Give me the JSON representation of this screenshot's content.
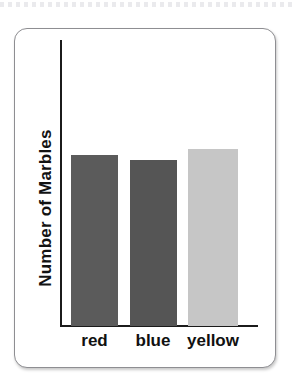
{
  "page": {
    "background_color": "#ffffff",
    "top_rule": {
      "style": "dotted",
      "color": "#e9e9ec"
    }
  },
  "card": {
    "border_color": "#8e8e92",
    "background_color": "#ffffff",
    "corner_radius_px": 13
  },
  "chart_data": {
    "type": "bar",
    "title": "",
    "subtitle": "",
    "xlabel": "",
    "ylabel": "Number of Marbles",
    "categories": [
      "red",
      "blue",
      "yellow"
    ],
    "values": [
      171,
      166,
      177
    ],
    "series": [
      {
        "name": "Number of Marbles",
        "values": [
          171,
          166,
          177
        ]
      }
    ],
    "bar_colors": [
      "#5b5b5b",
      "#555555",
      "#c6c6c6"
    ],
    "ylim": [
      0,
      287
    ],
    "tick_labels_y": [],
    "grid": false,
    "legend": false,
    "legend_position": "none",
    "axis_color": "#1b1b1b",
    "annotations": []
  },
  "axes": {
    "y_title": "Number of Marbles",
    "y_title_color": "#121212",
    "x_tick_labels": [
      "red",
      "blue",
      "yellow"
    ],
    "x_tick_label_color": "#111111"
  }
}
